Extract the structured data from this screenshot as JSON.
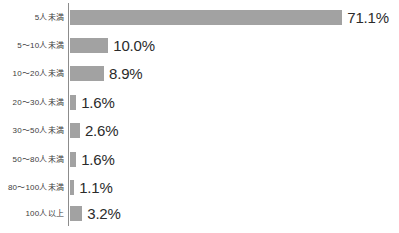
{
  "chart_data": {
    "type": "bar",
    "orientation": "horizontal",
    "title": "",
    "subtitle": "",
    "xlabel": "",
    "ylabel": "",
    "xlim": [
      0,
      75
    ],
    "grid": false,
    "legend": null,
    "value_suffix": "%",
    "categories": [
      "5人未満",
      "5～10人未満",
      "10～20人未満",
      "20～30人未満",
      "30～50人未満",
      "50～80人未満",
      "80～100人未満",
      "100人以上"
    ],
    "values": [
      71.1,
      10.0,
      8.9,
      1.6,
      2.6,
      1.6,
      1.1,
      3.2
    ],
    "value_labels": [
      "71.1%",
      "10.0%",
      "8.9%",
      "1.6%",
      "2.6%",
      "1.6%",
      "1.1%",
      "3.2%"
    ],
    "bar_color": "#a2a2a2",
    "axis_color": "#8c8c8c",
    "label_color": "#3d3d3d",
    "value_color": "#2b2b2b",
    "background_color": "#ffffff"
  },
  "layout": {
    "axis_x": 68,
    "bar_origin_x": 70,
    "px_per_percent": 3.83,
    "row_tops": [
      8,
      36,
      64,
      93,
      121,
      150,
      178,
      204
    ],
    "bar_height": 15
  }
}
